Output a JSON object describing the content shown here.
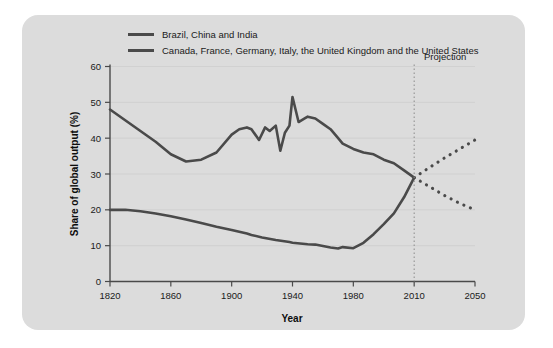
{
  "figure": {
    "panel_color": "#dcdcdc",
    "background_color": "#ffffff",
    "line_color": "#4a4a4a",
    "axis_color": "#4a4a4a",
    "grid_color": "#cbcbcb"
  },
  "legend": {
    "position": "top-left",
    "entries": [
      {
        "label": "Brazil, China and India",
        "color": "#4a4a4a"
      },
      {
        "label": "Canada, France, Germany, Italy, the United Kingdom and the United States",
        "color": "#4a4a4a"
      }
    ]
  },
  "annotations": [
    {
      "text": "Projection",
      "x_year": 2010,
      "note": "dotted vertical divider at 2010; label to the right"
    }
  ],
  "chart_data": {
    "type": "line",
    "title": "",
    "subtitle": "",
    "xlabel": "Year",
    "ylabel": "Share of global output (%)",
    "xlim": [
      1820,
      2050
    ],
    "ylim": [
      0,
      60
    ],
    "xticks": [
      1820,
      1860,
      1900,
      1940,
      1980,
      2010,
      2050
    ],
    "xtick_labels": [
      "1820",
      "1860",
      "1900",
      "1940",
      "1980",
      "2010",
      "2050"
    ],
    "yticks": [
      0,
      10,
      20,
      30,
      40,
      50,
      60
    ],
    "ytick_labels": [
      "0",
      "10",
      "20",
      "30",
      "40",
      "50",
      "60"
    ],
    "grid": "horizontal-faint",
    "legend_position": "above-plot-left",
    "projection_start_year": 2010,
    "series": [
      {
        "name": "Brazil, China and India",
        "color": "#4a4a4a",
        "style": "solid",
        "x": [
          1820,
          1830,
          1840,
          1850,
          1860,
          1870,
          1880,
          1890,
          1900,
          1910,
          1913,
          1920,
          1929,
          1938,
          1940,
          1945,
          1950,
          1955,
          1960,
          1965,
          1970,
          1973,
          1980,
          1985,
          1990,
          1995,
          2000,
          2005,
          2010
        ],
        "values": [
          20.0,
          20.0,
          19.6,
          19.0,
          18.2,
          17.3,
          16.3,
          15.3,
          14.4,
          13.4,
          13.0,
          12.3,
          11.6,
          11.0,
          10.8,
          10.6,
          10.4,
          10.3,
          9.9,
          9.5,
          9.2,
          9.6,
          9.3,
          10.8,
          13.2,
          16.0,
          19.0,
          23.5,
          29.0
        ]
      },
      {
        "name": "Brazil, China and India (projection)",
        "color": "#4a4a4a",
        "style": "dotted",
        "x": [
          2010,
          2020,
          2030,
          2040,
          2050
        ],
        "values": [
          29.0,
          31.8,
          34.5,
          37.0,
          39.5
        ]
      },
      {
        "name": "Canada, France, Germany, Italy, the United Kingdom and the United States",
        "color": "#4a4a4a",
        "style": "solid",
        "x": [
          1820,
          1830,
          1840,
          1850,
          1860,
          1870,
          1880,
          1890,
          1900,
          1905,
          1910,
          1913,
          1918,
          1922,
          1925,
          1929,
          1932,
          1935,
          1938,
          1940,
          1944,
          1948,
          1950,
          1955,
          1960,
          1965,
          1970,
          1973,
          1980,
          1985,
          1990,
          1995,
          2000,
          2005,
          2010
        ],
        "values": [
          48.0,
          45.0,
          42.0,
          39.0,
          35.5,
          33.5,
          34.0,
          36.0,
          41.0,
          42.5,
          43.0,
          42.5,
          39.5,
          43.0,
          42.0,
          43.5,
          36.5,
          41.5,
          43.5,
          51.5,
          44.5,
          45.5,
          46.0,
          45.5,
          44.0,
          42.5,
          40.0,
          38.5,
          37.0,
          36.0,
          35.5,
          34.0,
          33.0,
          31.0,
          29.0
        ]
      },
      {
        "name": "Canada, France, Germany, Italy, the United Kingdom and the United States (projection)",
        "color": "#4a4a4a",
        "style": "dotted",
        "x": [
          2010,
          2020,
          2030,
          2040,
          2050
        ],
        "values": [
          29.0,
          26.5,
          24.0,
          21.8,
          20.0
        ]
      }
    ]
  }
}
